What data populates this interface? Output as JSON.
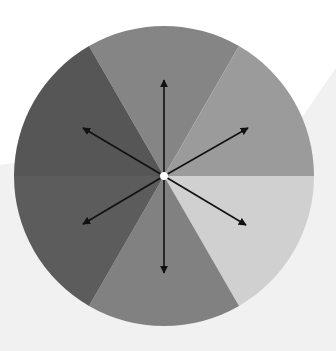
{
  "diagram": {
    "title": "",
    "type": "radial sector wheel with bidirectional arrows",
    "background": {
      "top_color": "#ffffff",
      "bottom_color": "#f1f1f1"
    },
    "circle": {
      "cx": 164,
      "cy": 176,
      "r": 150
    },
    "sectors": [
      {
        "name": "top",
        "start_deg": -30,
        "end_deg": 30,
        "color": "#858585"
      },
      {
        "name": "top-right",
        "start_deg": 30,
        "end_deg": 90,
        "color": "#9b9b9b"
      },
      {
        "name": "bottom-right",
        "start_deg": 90,
        "end_deg": 150,
        "color": "#d0d0d0"
      },
      {
        "name": "bottom",
        "start_deg": 150,
        "end_deg": 210,
        "color": "#818181"
      },
      {
        "name": "bottom-left",
        "start_deg": 210,
        "end_deg": 270,
        "color": "#5c5c5c"
      },
      {
        "name": "top-left",
        "start_deg": 270,
        "end_deg": 330,
        "color": "#565656"
      }
    ],
    "arrows": [
      {
        "name": "arrow-up",
        "x": 164,
        "y": 80
      },
      {
        "name": "arrow-down",
        "x": 164,
        "y": 273
      },
      {
        "name": "arrow-upper-right",
        "x": 248,
        "y": 128
      },
      {
        "name": "arrow-lower-left",
        "x": 83,
        "y": 224
      },
      {
        "name": "arrow-upper-left",
        "x": 83,
        "y": 128
      },
      {
        "name": "arrow-lower-right",
        "x": 246,
        "y": 225
      }
    ],
    "arrow_color": "#111111",
    "center_dot_color": "#ffffff"
  }
}
